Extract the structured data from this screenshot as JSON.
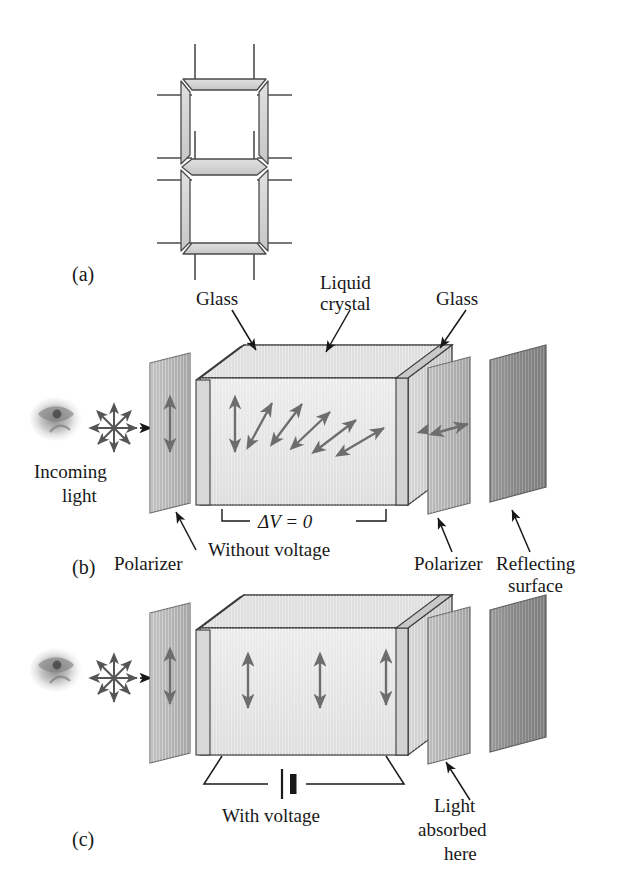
{
  "figure": {
    "background_color": "#ffffff",
    "ink_color": "#181818",
    "panels": [
      {
        "id": "a",
        "label": "(a)",
        "subject": "seven-segment-display",
        "segment_count": 7,
        "electrode_lead_count": 8,
        "segment_fill": "#d4d4d4",
        "segment_edge": "#4a4a4a"
      },
      {
        "id": "b",
        "label": "(b)",
        "state_label": "Without voltage",
        "voltage_label": "ΔV = 0",
        "light_transmitted": true,
        "annotations": [
          {
            "name": "glass-left",
            "text": "Glass"
          },
          {
            "name": "liquid-crystal",
            "text": "Liquid\ncrystal",
            "line1": "Liquid",
            "line2": "crystal"
          },
          {
            "name": "glass-right",
            "text": "Glass"
          },
          {
            "name": "incoming-light",
            "line1": "Incoming",
            "line2": "light"
          },
          {
            "name": "polarizer-left",
            "text": "Polarizer"
          },
          {
            "name": "polarizer-right",
            "text": "Polarizer"
          },
          {
            "name": "reflecting-surface",
            "line1": "Reflecting",
            "line2": "surface"
          }
        ],
        "polarization_arrows": {
          "input_polarizer": "vertical",
          "inside_cell": "twisted",
          "output_polarizer": "horizontal"
        }
      },
      {
        "id": "c",
        "label": "(c)",
        "state_label": "With voltage",
        "light_transmitted": false,
        "annotations": [
          {
            "name": "light-absorbed",
            "line1": "Light",
            "line2": "absorbed",
            "line3": "here"
          }
        ],
        "polarization_arrows": {
          "input_polarizer": "vertical",
          "inside_cell": "vertical",
          "output_polarizer": "none"
        },
        "circuit": {
          "component": "battery",
          "name": "battery-symbol"
        }
      }
    ],
    "colors": {
      "polarizer_light": "#b9b9b9",
      "polarizer_mid": "#a8a8a8",
      "reflector_dark": "#8d8d8d",
      "cell_face": "#e3e3e3",
      "cell_top": "#dcdcdc",
      "cell_side": "#cfcfcf",
      "glass_plate": "#c9c9c9",
      "arrow_gray": "#6d6d6d",
      "outline": "#3c3c3c"
    }
  }
}
